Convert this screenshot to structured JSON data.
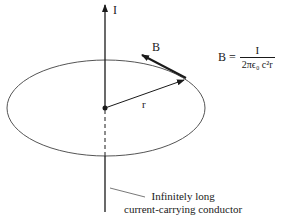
{
  "diagram": {
    "labels": {
      "current": "I",
      "field": "B",
      "radius": "r"
    },
    "formula": {
      "lhs": "B =",
      "numerator": "I",
      "denominator": "2πϵ₀ c²r"
    },
    "caption": {
      "line1": "Infinitely long",
      "line2": "current-carrying conductor"
    },
    "colors": {
      "ink": "#1a1a1a",
      "ellipse": "#555555"
    }
  }
}
